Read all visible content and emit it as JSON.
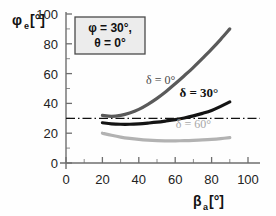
{
  "figure": {
    "background_color": "#ffffff",
    "annotation_box": {
      "line1": "φ = 30°,",
      "line2": "θ = 0°",
      "fill_color": "#ececec",
      "border_color": "#4a4a4a"
    }
  },
  "chart_data": {
    "type": "line",
    "title": "",
    "subtitle": "",
    "xlabel": "β",
    "xlabel_sub": "a",
    "xlabel_unit": "[°]",
    "ylabel": "φ",
    "ylabel_sub": "e",
    "ylabel_unit": "[°]",
    "xlim": [
      0,
      100
    ],
    "ylim": [
      0,
      100
    ],
    "xticks": [
      0,
      20,
      40,
      60,
      80,
      100
    ],
    "yticks": [
      0,
      20,
      40,
      60,
      80,
      100
    ],
    "xtick_labels": [
      "0",
      "20",
      "40",
      "60",
      "80",
      "100"
    ],
    "ytick_labels": [
      "0",
      "20",
      "40",
      "60",
      "80",
      "100"
    ],
    "x_minor_tick_step": 10,
    "y_minor_tick_step": 10,
    "grid": false,
    "legend_position": "inline-curve-labels",
    "reference_line": {
      "label": "",
      "orientation": "horizontal",
      "y": 30,
      "style": "dash-dot",
      "color": "#111111"
    },
    "x": [
      20,
      25,
      30,
      35,
      40,
      45,
      50,
      55,
      60,
      65,
      70,
      75,
      80,
      85,
      90
    ],
    "series": [
      {
        "name": "δ = 0°",
        "label": "δ = 0°",
        "color": "#5a5a5a",
        "label_x": 52,
        "label_y": 53,
        "values": [
          32.0,
          31.3,
          32.0,
          33.6,
          36.0,
          39.4,
          43.4,
          48.0,
          53.2,
          58.6,
          64.2,
          70.2,
          76.4,
          83.0,
          90.0
        ]
      },
      {
        "name": "δ = 30°",
        "label": "δ = 30°",
        "color": "#141414",
        "label_x": 73,
        "label_y": 44,
        "values": [
          27.0,
          26.3,
          26.0,
          26.0,
          26.3,
          26.8,
          27.4,
          28.2,
          29.1,
          30.2,
          31.6,
          33.3,
          35.3,
          38.0,
          41.0
        ]
      },
      {
        "name": "δ = 60°",
        "label": "δ = 60°",
        "color": "#b2b2b2",
        "label_x": 70,
        "label_y": 23.5,
        "values": [
          20.0,
          18.6,
          17.4,
          16.5,
          15.8,
          15.3,
          15.0,
          14.9,
          14.9,
          15.0,
          15.2,
          15.5,
          15.9,
          16.4,
          17.0
        ]
      }
    ]
  }
}
